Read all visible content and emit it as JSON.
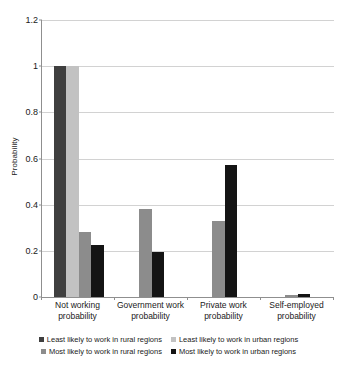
{
  "chart_data": {
    "type": "bar",
    "title": "",
    "xlabel": "",
    "ylabel": "Probability",
    "ylim": [
      0,
      1.2
    ],
    "yticks": [
      "0",
      "0.2",
      "0.4",
      "0.6",
      "0.8",
      "1",
      "1.2"
    ],
    "ytick_values": [
      0,
      0.2,
      0.4,
      0.6,
      0.8,
      1,
      1.2
    ],
    "grid": true,
    "legend_position": "bottom",
    "categories": [
      "Not working probability",
      "Government work probability",
      "Private work probability",
      "Self-employed probability"
    ],
    "category_lines": [
      [
        "Not working",
        "probability"
      ],
      [
        "Government work",
        "probability"
      ],
      [
        "Private work",
        "probability"
      ],
      [
        "Self-employed",
        "probability"
      ]
    ],
    "series": [
      {
        "name": "Least likely to work in rural regions",
        "color": "#3f3f3f",
        "values": [
          1.0,
          0,
          0,
          0
        ]
      },
      {
        "name": "Least likely to work in urban regions",
        "color": "#c2c2c2",
        "values": [
          1.0,
          0,
          0,
          0
        ]
      },
      {
        "name": "Most likely to work in rural regions",
        "color": "#8c8c8c",
        "values": [
          0.28,
          0.38,
          0.33,
          0.008
        ]
      },
      {
        "name": "Most likely to work in urban regions",
        "color": "#141414",
        "values": [
          0.225,
          0.193,
          0.57,
          0.015
        ]
      }
    ]
  },
  "legend": {
    "rows": [
      [
        {
          "label": "Least likely to work in rural regions",
          "color": "#3f3f3f"
        },
        {
          "label": "Least likely to work in urban regions",
          "color": "#c2c2c2"
        }
      ],
      [
        {
          "label": "Most likely to work in rural regions",
          "color": "#8c8c8c"
        },
        {
          "label": "Most likely to work in urban regions",
          "color": "#141414"
        }
      ]
    ]
  }
}
